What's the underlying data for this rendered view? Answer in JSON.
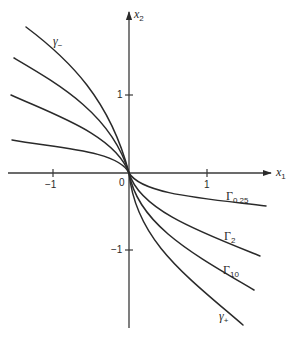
{
  "figure": {
    "axes": {
      "x_label": "x",
      "x_label_sub": "1",
      "y_label": "x",
      "y_label_sub": "2",
      "origin_label": "0",
      "x_ticks": [
        {
          "value": -1,
          "label": "−1"
        },
        {
          "value": 1,
          "label": "1"
        }
      ],
      "y_ticks": [
        {
          "value": 1,
          "label": "1"
        },
        {
          "value": -1,
          "label": "−1"
        }
      ]
    },
    "curves": [
      {
        "name": "gamma-minus",
        "label": "γ",
        "label_sub": "−",
        "quadrant": "upper-left"
      },
      {
        "name": "curve-upper-2",
        "label": "",
        "quadrant": "upper-left"
      },
      {
        "name": "curve-upper-3",
        "label": "",
        "quadrant": "upper-left"
      },
      {
        "name": "curve-upper-4",
        "label": "",
        "quadrant": "upper-left"
      },
      {
        "name": "Gamma-0.25",
        "label": "Γ",
        "label_sub": "0.25",
        "quadrant": "lower-right"
      },
      {
        "name": "Gamma-2",
        "label": "Γ",
        "label_sub": "2",
        "quadrant": "lower-right"
      },
      {
        "name": "Gamma-10",
        "label": "Γ",
        "label_sub": "10",
        "quadrant": "lower-right"
      },
      {
        "name": "gamma-plus",
        "label": "γ",
        "label_sub": "+",
        "quadrant": "lower-right"
      }
    ]
  }
}
